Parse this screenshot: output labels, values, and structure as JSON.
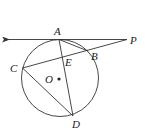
{
  "diagram": {
    "type": "circle-tangent-secant",
    "circle": {
      "center": [
        60,
        78
      ],
      "radius": 38.5
    },
    "points": {
      "A": {
        "label": "A",
        "pos": [
          59,
          39.5
        ],
        "label_pos": [
          54,
          35
        ]
      },
      "B": {
        "label": "B",
        "pos": [
          88,
          51
        ],
        "label_pos": [
          91,
          60
        ]
      },
      "C": {
        "label": "C",
        "pos": [
          22.5,
          68
        ],
        "label_pos": [
          10,
          72
        ]
      },
      "D": {
        "label": "D",
        "pos": [
          73,
          116
        ],
        "label_pos": [
          73,
          128
        ]
      },
      "E": {
        "label": "E",
        "pos": [
          62.5,
          57
        ],
        "label_pos": [
          65,
          66
        ]
      },
      "O": {
        "label": "O",
        "pos": [
          59,
          79
        ],
        "label_pos": [
          45,
          83
        ]
      },
      "P": {
        "label": "P",
        "pos": [
          127,
          39.5
        ],
        "label_pos": [
          130,
          44
        ]
      }
    },
    "segments": [
      [
        "P",
        "arrow_end"
      ],
      [
        "P",
        "C"
      ],
      [
        "A",
        "D"
      ],
      [
        "C",
        "D"
      ],
      [
        "A",
        "B"
      ]
    ],
    "arrow_end": [
      7,
      39.5
    ],
    "stroke_color": "#333333"
  }
}
